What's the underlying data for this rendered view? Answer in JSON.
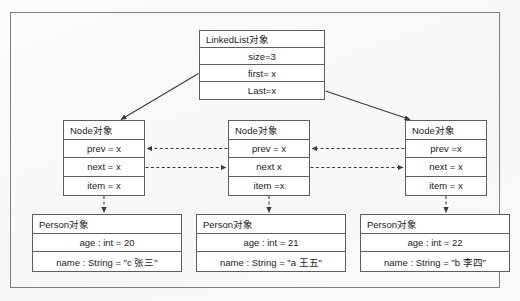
{
  "diagram": {
    "frame": {
      "name": "outer-frame"
    },
    "linkedlist": {
      "header": "LinkedList对象",
      "rows": [
        {
          "key": "size",
          "text": "size=3"
        },
        {
          "key": "first",
          "text": "first= x"
        },
        {
          "key": "last",
          "text": "Last=x"
        }
      ]
    },
    "nodes": [
      {
        "header": "Node对象",
        "rows": [
          {
            "key": "prev",
            "text": "prev = x"
          },
          {
            "key": "next",
            "text": "next = x"
          },
          {
            "key": "item",
            "text": "item = x"
          }
        ]
      },
      {
        "header": "Node对象",
        "rows": [
          {
            "key": "prev",
            "text": "prev = x"
          },
          {
            "key": "next",
            "text": "next x"
          },
          {
            "key": "item",
            "text": "item =x"
          }
        ]
      },
      {
        "header": "Node对象",
        "rows": [
          {
            "key": "prev",
            "text": "prev =x"
          },
          {
            "key": "next",
            "text": "next = x"
          },
          {
            "key": "item",
            "text": "item = x"
          }
        ]
      }
    ],
    "persons": [
      {
        "header": "Person对象",
        "rows": [
          {
            "key": "age",
            "text": "age : int = 20"
          },
          {
            "key": "name",
            "text": "name : String = \"c 张三\""
          }
        ]
      },
      {
        "header": "Person对象",
        "rows": [
          {
            "key": "age",
            "text": "age : int = 21"
          },
          {
            "key": "name",
            "text": "name : String = \"a 王五\""
          }
        ]
      },
      {
        "header": "Person对象",
        "rows": [
          {
            "key": "age",
            "text": "age : int = 22"
          },
          {
            "key": "name",
            "text": "name : String = \"b 李四\""
          }
        ]
      }
    ],
    "connectors": [
      {
        "name": "first-pointer-arrow",
        "style": "solid",
        "from": "linkedlist.first",
        "to": "node-1.header"
      },
      {
        "name": "last-pointer-arrow",
        "style": "solid",
        "from": "linkedlist.last",
        "to": "node-3.header"
      },
      {
        "name": "node2-prev-to-node1-arrow",
        "style": "dashed",
        "from": "node-2.prev",
        "to": "node-1"
      },
      {
        "name": "node1-next-to-node2-arrow",
        "style": "dashed",
        "from": "node-1.next",
        "to": "node-2"
      },
      {
        "name": "node3-prev-to-node2-arrow",
        "style": "dashed",
        "from": "node-3.prev",
        "to": "node-2"
      },
      {
        "name": "node2-next-to-node3-arrow",
        "style": "dashed",
        "from": "node-2.next",
        "to": "node-3"
      },
      {
        "name": "node1-item-to-person1-arrow",
        "style": "dashed",
        "from": "node-1.item",
        "to": "person-1"
      },
      {
        "name": "node2-item-to-person2-arrow",
        "style": "dashed",
        "from": "node-2.item",
        "to": "person-2"
      },
      {
        "name": "node3-item-to-person3-arrow",
        "style": "dashed",
        "from": "node-3.item",
        "to": "person-3"
      }
    ],
    "colors": {
      "box_border": "#5d5d5d",
      "frame_border": "#7d7d7d",
      "connector": "#3a3a3a",
      "text": "#1b1b1b",
      "background": "#fdfdfc"
    }
  }
}
